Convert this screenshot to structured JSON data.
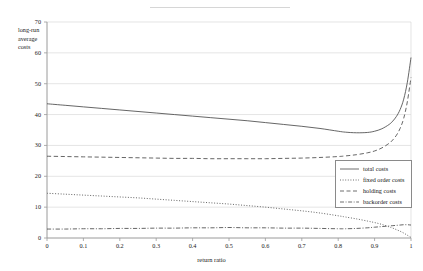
{
  "axes": {
    "ylabel_lines": [
      "long-run",
      "average",
      "costs"
    ],
    "xlabel": "return ratio",
    "yticks": [
      "0",
      "10",
      "20",
      "30",
      "40",
      "50",
      "60",
      "70"
    ],
    "xticks": [
      "0",
      "0.1",
      "0.2",
      "0.3",
      "0.4",
      "0.5",
      "0.6",
      "0.7",
      "0.8",
      "0.9",
      "1"
    ]
  },
  "legend": {
    "items": [
      {
        "label": "total costs",
        "style": "solid"
      },
      {
        "label": "fixed order costs",
        "style": "dotted"
      },
      {
        "label": "holding costs",
        "style": "dashed"
      },
      {
        "label": "backorder costs",
        "style": "dashdot"
      }
    ]
  },
  "colors": {
    "line": "#4a4a4a",
    "grid": "#d9d9d9",
    "axis": "#9a9a9a",
    "text": "#222222"
  },
  "chart_data": {
    "type": "line",
    "title": "",
    "xlabel": "return ratio",
    "ylabel": "long-run average costs",
    "xlim": [
      0,
      1
    ],
    "ylim": [
      0,
      70
    ],
    "grid": true,
    "legend_position": "inside-right",
    "x": [
      0,
      0.05,
      0.1,
      0.15,
      0.2,
      0.25,
      0.3,
      0.35,
      0.4,
      0.45,
      0.5,
      0.55,
      0.6,
      0.65,
      0.7,
      0.75,
      0.8,
      0.82,
      0.85,
      0.88,
      0.9,
      0.92,
      0.94,
      0.95,
      0.96,
      0.97,
      0.98,
      0.99,
      1.0
    ],
    "series": [
      {
        "name": "total costs",
        "style": "solid",
        "values": [
          43.5,
          43.0,
          42.5,
          42.0,
          41.5,
          41.0,
          40.5,
          40.0,
          39.5,
          39.0,
          38.5,
          38.0,
          37.4,
          36.8,
          36.2,
          35.5,
          34.6,
          34.3,
          34.1,
          34.2,
          34.6,
          35.4,
          36.8,
          37.9,
          39.4,
          41.6,
          45.0,
          50.5,
          58.5
        ]
      },
      {
        "name": "fixed order costs",
        "style": "dotted",
        "values": [
          14.5,
          14.2,
          13.9,
          13.6,
          13.3,
          13.0,
          12.6,
          12.2,
          11.8,
          11.4,
          11.0,
          10.5,
          10.0,
          9.4,
          8.8,
          8.1,
          7.2,
          6.8,
          6.2,
          5.5,
          5.0,
          4.4,
          3.6,
          3.2,
          2.7,
          2.2,
          1.6,
          0.9,
          0.2
        ]
      },
      {
        "name": "holding costs",
        "style": "dashed",
        "values": [
          26.5,
          26.4,
          26.3,
          26.2,
          26.1,
          26.0,
          25.9,
          25.8,
          25.8,
          25.7,
          25.7,
          25.7,
          25.7,
          25.8,
          25.9,
          26.1,
          26.4,
          26.6,
          27.0,
          27.6,
          28.2,
          29.2,
          30.7,
          31.8,
          33.3,
          35.5,
          38.8,
          44.2,
          52.0
        ]
      },
      {
        "name": "backorder costs",
        "style": "dashdot",
        "values": [
          2.9,
          2.9,
          3.0,
          3.0,
          3.1,
          3.1,
          3.2,
          3.2,
          3.3,
          3.3,
          3.4,
          3.3,
          3.3,
          3.2,
          3.2,
          3.1,
          3.0,
          3.0,
          3.1,
          3.3,
          3.5,
          3.7,
          3.9,
          4.0,
          4.1,
          4.2,
          4.3,
          4.3,
          4.2
        ]
      }
    ]
  }
}
